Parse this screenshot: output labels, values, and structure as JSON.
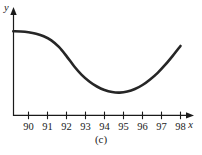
{
  "figure": {
    "caption": "(c)",
    "background_color": "#ffffff",
    "curve_color": "#262626",
    "axis_color": "#1a1a1a"
  },
  "chart_data": {
    "type": "line",
    "title": "",
    "subtitle": "",
    "xlabel": "x",
    "ylabel": "y",
    "caption": "(c)",
    "grid": false,
    "legend": null,
    "xlim": [
      89.2,
      98.6
    ],
    "ylim": [
      0,
      10
    ],
    "xticks": [
      90,
      91,
      92,
      93,
      94,
      95,
      96,
      97,
      98
    ],
    "xticklabels": [
      "90",
      "91",
      "92",
      "93",
      "94",
      "95",
      "96",
      "97",
      "98"
    ],
    "yticks": [],
    "yticklabels": [],
    "series": [
      {
        "name": "curve",
        "color": "#262626",
        "x": [
          89.2,
          89.6,
          90.0,
          90.4,
          90.8,
          91.2,
          91.6,
          92.0,
          92.4,
          92.8,
          93.2,
          93.6,
          94.0,
          94.4,
          94.8,
          95.2,
          95.6,
          96.0,
          96.4,
          96.8,
          97.2,
          97.6,
          98.0
        ],
        "y": [
          8.3,
          8.28,
          8.2,
          8.05,
          7.8,
          7.4,
          6.75,
          5.85,
          4.85,
          4.0,
          3.35,
          2.85,
          2.5,
          2.3,
          2.25,
          2.35,
          2.6,
          3.0,
          3.55,
          4.2,
          5.0,
          5.9,
          6.85
        ]
      }
    ],
    "annotations": [
      {
        "text": "y",
        "role": "y-axis-label",
        "italic": true
      },
      {
        "text": "x",
        "role": "x-axis-label",
        "italic": true
      }
    ],
    "features": {
      "shape": "decreasing then increasing (single minimum)",
      "minimum_x": 94.8,
      "start_x": 89.2,
      "end_x": 98.0
    }
  }
}
